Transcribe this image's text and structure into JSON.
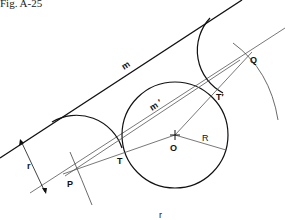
{
  "figure": {
    "caption": "Fig. A-25"
  },
  "labels": {
    "m": "m",
    "m_prime": "m ′",
    "r_side": "r",
    "r_bottom": "r",
    "P": "P",
    "T": "T",
    "O": "O",
    "R": "R",
    "T_prime": "T′",
    "Q": "Q"
  },
  "elements": {
    "line_m": "line m (given straight line)",
    "line_m_prime": "line m′ parallel to m at distance r",
    "circle_O": "given circle centre O, radius R",
    "arc_tangent_left": "tangent arc radius r touching m and circle at T",
    "arc_tangent_right": "tangent arc radius r touching m and circle at T′",
    "construction_arcs": "arcs radius R + r from O locating P and Q"
  },
  "colors": {
    "ink": "#111111",
    "construction": "#555555",
    "background": "#ffffff"
  }
}
